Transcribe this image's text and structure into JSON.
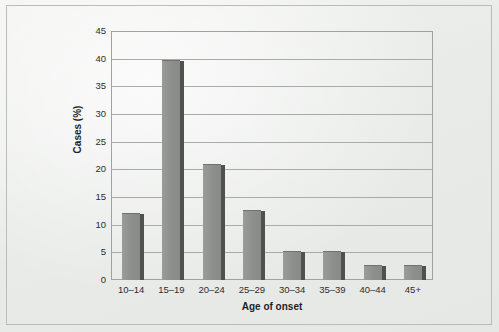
{
  "chart_data": {
    "type": "bar",
    "title": "",
    "xlabel": "Age of onset",
    "ylabel": "Cases (%)",
    "categories": [
      "10–14",
      "15–19",
      "20–24",
      "25–29",
      "30–34",
      "35–39",
      "40–44",
      "45+"
    ],
    "values": [
      12,
      39.5,
      20.8,
      12.5,
      5,
      5,
      2.5,
      2.5
    ],
    "ylim": [
      0,
      45
    ],
    "yticks": [
      0,
      5,
      10,
      15,
      20,
      25,
      30,
      35,
      40,
      45
    ],
    "ytick_labels": [
      "0",
      "5",
      "10",
      "15",
      "20",
      "25",
      "30",
      "35",
      "40",
      "45"
    ],
    "grid": "horizontal",
    "legend": "none",
    "series_color": "#8d8f8c",
    "bar_edge_color": "#4e514e"
  }
}
